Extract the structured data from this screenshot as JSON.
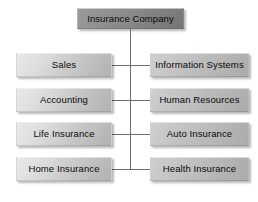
{
  "diagram": {
    "type": "organizational-chart",
    "root": {
      "label": "Insurance Company"
    },
    "colors": {
      "background": "#ffffff",
      "root_fill": "#8e8e8e",
      "left_fill": "#dcdcdc",
      "right_fill": "#c4c4c4",
      "connector": "#6e6e6e",
      "text": "#0b0b0b"
    },
    "rows": [
      {
        "left": "Sales",
        "right": "Information Systems"
      },
      {
        "left": "Accounting",
        "right": "Human Resources"
      },
      {
        "left": "Life Insurance",
        "right": "Auto Insurance"
      },
      {
        "left": "Home Insurance",
        "right": "Health Insurance"
      }
    ],
    "departments": [
      "Sales",
      "Information Systems",
      "Accounting",
      "Human Resources",
      "Life Insurance",
      "Auto Insurance",
      "Home Insurance",
      "Health Insurance"
    ]
  }
}
